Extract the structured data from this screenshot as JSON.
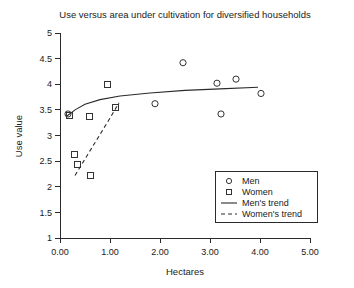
{
  "chart_data": {
    "type": "scatter",
    "title": "Use versus area under cultivation for diversified households",
    "xlabel": "Hectares",
    "ylabel": "Use value",
    "xlim": [
      0,
      5
    ],
    "ylim": [
      1,
      5
    ],
    "xticks": [
      "0.00",
      "1.00",
      "2.00",
      "3.00",
      "4.00",
      "5.00"
    ],
    "xtick_values": [
      0,
      1,
      2,
      3,
      4,
      5
    ],
    "yticks": [
      "1",
      "1.5",
      "2",
      "2.5",
      "3",
      "3.5",
      "4",
      "4.5",
      "5"
    ],
    "ytick_values": [
      1,
      1.5,
      2,
      2.5,
      3,
      3.5,
      4,
      4.5,
      5
    ],
    "grid": false,
    "legend_position": "lower-right",
    "series": [
      {
        "name": "Men",
        "marker": "circle",
        "points": [
          {
            "x": 0.16,
            "y": 3.42
          },
          {
            "x": 1.9,
            "y": 3.62
          },
          {
            "x": 2.46,
            "y": 4.42
          },
          {
            "x": 3.14,
            "y": 4.02
          },
          {
            "x": 3.52,
            "y": 4.1
          },
          {
            "x": 4.02,
            "y": 3.82
          },
          {
            "x": 3.22,
            "y": 3.42
          }
        ]
      },
      {
        "name": "Women",
        "marker": "square",
        "points": [
          {
            "x": 0.18,
            "y": 3.4
          },
          {
            "x": 0.58,
            "y": 3.38
          },
          {
            "x": 0.94,
            "y": 4.0
          },
          {
            "x": 1.1,
            "y": 3.54
          },
          {
            "x": 0.28,
            "y": 2.62
          },
          {
            "x": 0.34,
            "y": 2.44
          },
          {
            "x": 0.6,
            "y": 2.22
          }
        ]
      }
    ],
    "trends": [
      {
        "name": "Men's trend",
        "style": "solid",
        "points": [
          {
            "x": 0.14,
            "y": 3.38
          },
          {
            "x": 0.3,
            "y": 3.5
          },
          {
            "x": 0.5,
            "y": 3.61
          },
          {
            "x": 0.8,
            "y": 3.7
          },
          {
            "x": 1.2,
            "y": 3.77
          },
          {
            "x": 1.8,
            "y": 3.83
          },
          {
            "x": 2.5,
            "y": 3.88
          },
          {
            "x": 3.2,
            "y": 3.91
          },
          {
            "x": 3.96,
            "y": 3.94
          }
        ]
      },
      {
        "name": "Women's trend",
        "style": "dashed",
        "points": [
          {
            "x": 0.3,
            "y": 2.22
          },
          {
            "x": 0.55,
            "y": 2.62
          },
          {
            "x": 0.8,
            "y": 3.02
          },
          {
            "x": 1.0,
            "y": 3.34
          },
          {
            "x": 1.18,
            "y": 3.64
          }
        ]
      }
    ],
    "legend_entries": [
      {
        "label": "Men",
        "type": "circle"
      },
      {
        "label": "Women",
        "type": "square"
      },
      {
        "label": "Men's trend",
        "type": "solid-line"
      },
      {
        "label": "Women's trend",
        "type": "dashed-line"
      }
    ]
  }
}
